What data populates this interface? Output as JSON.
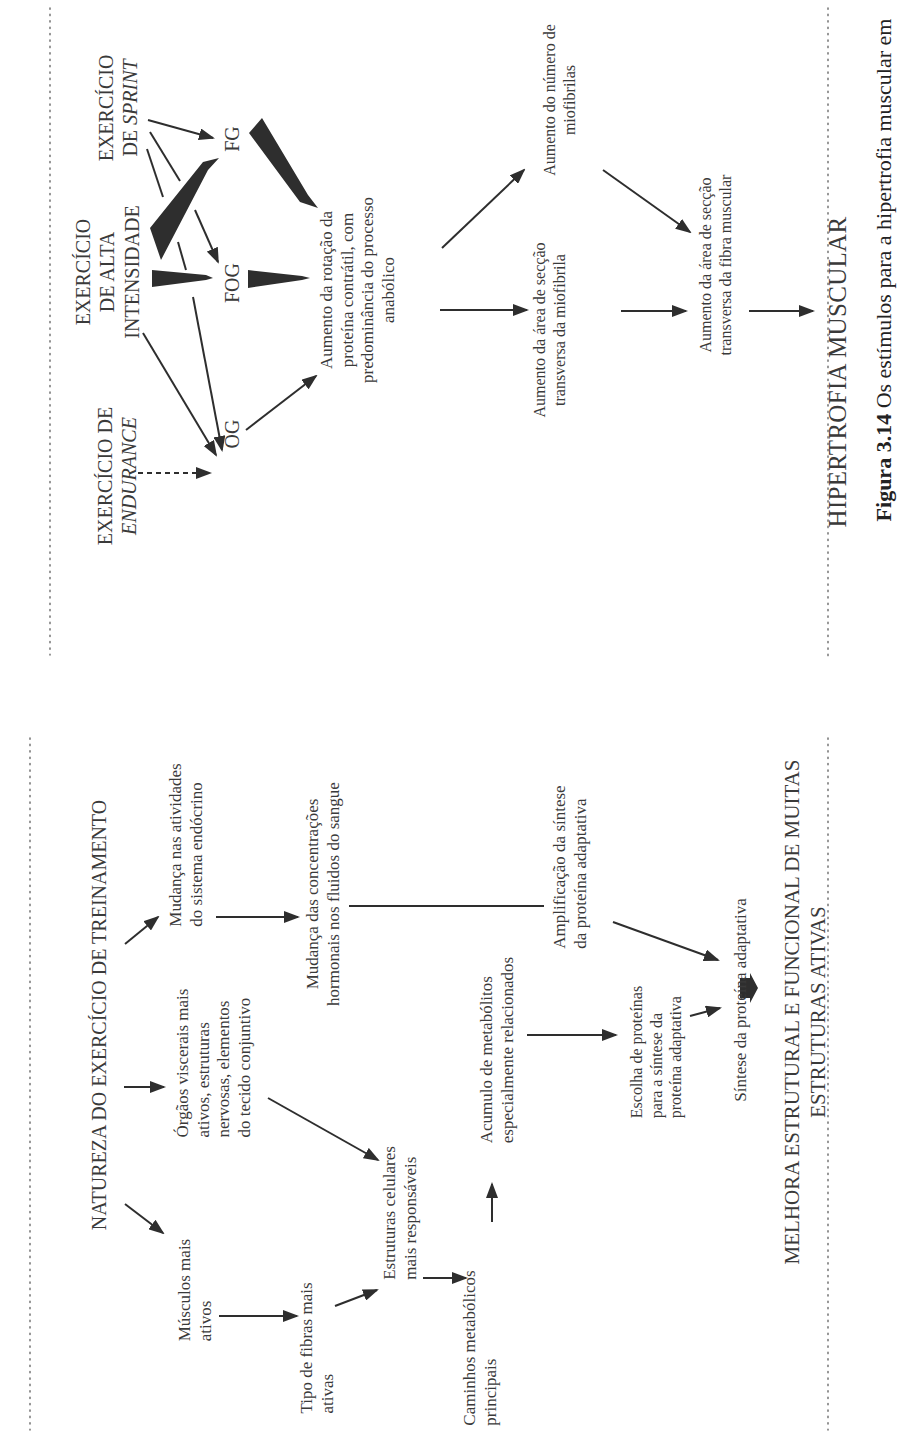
{
  "top_panel": {
    "stimuli": {
      "endurance": {
        "line1": "EXERCÍCIO DE",
        "line2": "ENDURANCE"
      },
      "high_intensity": {
        "line1": "EXERCÍCIO",
        "line2": "DE ALTA",
        "line3": "INTENSIDADE"
      },
      "sprint": {
        "line1": "EXERCÍCIO",
        "line2_prefix": "DE ",
        "line2_italic": "SPRINT"
      }
    },
    "fiber_types": {
      "og": "OG",
      "fog": "FOG",
      "fg": "FG"
    },
    "turnover": {
      "line1": "Aumento da rotação da",
      "line2": "proteína contrátil, com",
      "line3": "predominância do processo",
      "line4": "anabólico"
    },
    "myofibril_area": {
      "line1": "Aumento da área de secção",
      "line2": "transversa da miofibrila"
    },
    "myofibril_number": {
      "line1": "Aumento do número de",
      "line2": "miofibrilas"
    },
    "fiber_area": {
      "line1": "Aumento da área de secção",
      "line2": "transversa da fibra muscular"
    },
    "result": "HIPERTROFIA MUSCULAR"
  },
  "bottom_panel": {
    "title": "NATUREZA DO EXERCÍCIO DE TREINAMENTO",
    "muscles": {
      "line1": "Músculos mais",
      "line2": "ativos"
    },
    "organs": {
      "line1": "Órgãos viscerais mais",
      "line2": "ativos, estruturas",
      "line3": "nervosas, elementos",
      "line4": "do tecido conjuntivo"
    },
    "endocrine": {
      "line1": "Mudança nas atividades",
      "line2": "do sistema endócrino"
    },
    "fiber_type": {
      "line1": "Tipo de fibras mais",
      "line2": "ativas"
    },
    "cell_structures": {
      "line1": "Estruturas celulares",
      "line2": "mais responsáveis"
    },
    "hormones": {
      "line1": "Mudança das concentrações",
      "line2": "hormonais nos fluidos do sangue"
    },
    "metabolic": {
      "line1": "Caminhos metabólicos",
      "line2": "principais"
    },
    "metabolites": {
      "line1": "Acumulo de metabólitos",
      "line2": "especialmente relacionados"
    },
    "amplification": {
      "line1": "Amplificação da síntese",
      "line2": "da proteína adaptativa"
    },
    "protein_choice": {
      "line1": "Escolha de proteínas",
      "line2": "para a síntese da",
      "line3": "proteína adaptativa"
    },
    "synthesis": "Síntese da proteína adaptativa",
    "result": {
      "line1": "MELHORA ESTRUTURAL E FUNCIONAL DE MUITAS",
      "line2": "ESTRUTURAS ATIVAS"
    }
  },
  "caption": {
    "label": "Figura 3.14",
    "text": " Os estímulos para a hipertrofia muscular em"
  },
  "colors": {
    "ink": "#3a3a3a",
    "arrow": "#2e2e2e",
    "dots": "#7a7a7a",
    "background": "#ffffff"
  }
}
